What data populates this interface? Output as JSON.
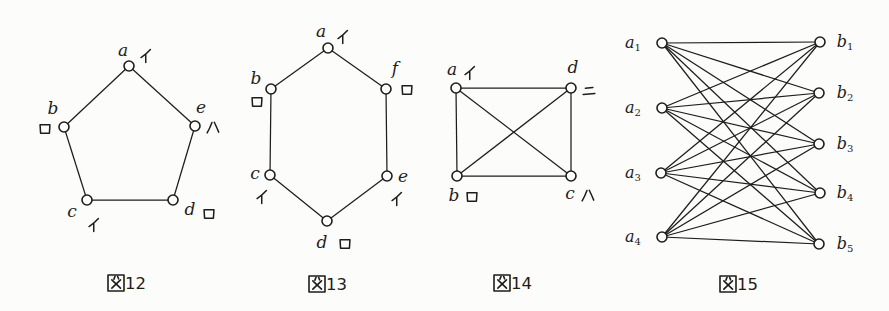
{
  "page": {
    "background": "#fcfcfa",
    "ink": "#1f1d1a",
    "vertex_fill": "#fdfdfb"
  },
  "figures": [
    {
      "name": "fig-12",
      "graph_type": "cycle-pentagon",
      "caption": {
        "text": "図12",
        "kanji": "図",
        "number": "12",
        "kx": 116,
        "dx": 125,
        "y": 289
      },
      "vertices": [
        {
          "id": "a",
          "x": 129,
          "y": 66,
          "label": "a",
          "lx": 123,
          "ly": 56,
          "kana": "イ",
          "kana_name": "i",
          "kx": 146,
          "ky": 56
        },
        {
          "id": "b",
          "x": 64,
          "y": 127,
          "label": "b",
          "lx": 53,
          "ly": 114,
          "kana": "ロ",
          "kana_name": "ro",
          "kx": 45,
          "ky": 129
        },
        {
          "id": "e",
          "x": 195,
          "y": 126,
          "label": "e",
          "lx": 201,
          "ly": 113,
          "kana": "ハ",
          "kana_name": "ha",
          "kx": 213,
          "ky": 128
        },
        {
          "id": "c",
          "x": 87,
          "y": 200,
          "label": "c",
          "lx": 72,
          "ly": 217,
          "kana": "イ",
          "kana_name": "i",
          "kx": 94,
          "ky": 225
        },
        {
          "id": "d",
          "x": 173,
          "y": 200,
          "label": "d",
          "lx": 190,
          "ly": 215,
          "kana": "ロ",
          "kana_name": "ro",
          "kx": 209,
          "ky": 214
        }
      ],
      "edges": [
        [
          "a",
          "b"
        ],
        [
          "a",
          "e"
        ],
        [
          "b",
          "c"
        ],
        [
          "e",
          "d"
        ],
        [
          "c",
          "d"
        ]
      ]
    },
    {
      "name": "fig-13",
      "graph_type": "cycle-hexagon",
      "caption": {
        "text": "図13",
        "kanji": "図",
        "number": "13",
        "kx": 317,
        "dx": 326,
        "y": 290
      },
      "vertices": [
        {
          "id": "a",
          "x": 328,
          "y": 48,
          "label": "a",
          "lx": 321,
          "ly": 37,
          "kana": "イ",
          "kana_name": "i",
          "kx": 343,
          "ky": 37
        },
        {
          "id": "b",
          "x": 271,
          "y": 89,
          "label": "b",
          "lx": 256,
          "ly": 84,
          "kana": "ロ",
          "kana_name": "ro",
          "kx": 257,
          "ky": 102
        },
        {
          "id": "f",
          "x": 386,
          "y": 89,
          "label": "f",
          "lx": 395,
          "ly": 74,
          "kana": "ロ",
          "kana_name": "ro",
          "kx": 407,
          "ky": 90
        },
        {
          "id": "c",
          "x": 270,
          "y": 175,
          "label": "c",
          "lx": 255,
          "ly": 179,
          "kana": "イ",
          "kana_name": "i",
          "kx": 262,
          "ky": 197
        },
        {
          "id": "e",
          "x": 387,
          "y": 176,
          "label": "e",
          "lx": 403,
          "ly": 182,
          "kana": "イ",
          "kana_name": "i",
          "kx": 397,
          "ky": 199
        },
        {
          "id": "d",
          "x": 327,
          "y": 221,
          "label": "d",
          "lx": 322,
          "ly": 248,
          "kana": "ロ",
          "kana_name": "ro",
          "kx": 345,
          "ky": 244
        }
      ],
      "edges": [
        [
          "a",
          "b"
        ],
        [
          "a",
          "f"
        ],
        [
          "b",
          "c"
        ],
        [
          "f",
          "e"
        ],
        [
          "c",
          "d"
        ],
        [
          "e",
          "d"
        ]
      ]
    },
    {
      "name": "fig-14",
      "graph_type": "complete-K4",
      "caption": {
        "text": "図14",
        "kanji": "図",
        "number": "14",
        "kx": 502,
        "dx": 511,
        "y": 289
      },
      "vertices": [
        {
          "id": "a",
          "x": 456,
          "y": 88,
          "label": "a",
          "lx": 452,
          "ly": 75,
          "kana": "イ",
          "kana_name": "i",
          "kx": 470,
          "ky": 73
        },
        {
          "id": "d",
          "x": 571,
          "y": 88,
          "label": "d",
          "lx": 573,
          "ly": 73,
          "kana": "ニ",
          "kana_name": "ni",
          "kx": 589,
          "ky": 91
        },
        {
          "id": "b",
          "x": 457,
          "y": 176,
          "label": "b",
          "lx": 454,
          "ly": 201,
          "kana": "ロ",
          "kana_name": "ro",
          "kx": 472,
          "ky": 197
        },
        {
          "id": "c",
          "x": 571,
          "y": 176,
          "label": "c",
          "lx": 570,
          "ly": 199,
          "kana": "ハ",
          "kana_name": "ha",
          "kx": 588,
          "ky": 196
        }
      ],
      "edges": [
        [
          "a",
          "d"
        ],
        [
          "a",
          "b"
        ],
        [
          "d",
          "c"
        ],
        [
          "b",
          "c"
        ],
        [
          "a",
          "c"
        ],
        [
          "b",
          "d"
        ]
      ]
    },
    {
      "name": "fig-15",
      "graph_type": "complete-bipartite-K45",
      "caption": {
        "text": "図15",
        "kanji": "図",
        "number": "15",
        "kx": 728,
        "dx": 737,
        "y": 290
      },
      "vertices": [
        {
          "id": "a1",
          "x": 662,
          "y": 43,
          "label": "a",
          "sub": "1",
          "lx": 633,
          "ly": 48
        },
        {
          "id": "a2",
          "x": 662,
          "y": 108,
          "label": "a",
          "sub": "2",
          "lx": 633,
          "ly": 113
        },
        {
          "id": "a3",
          "x": 661,
          "y": 173,
          "label": "a",
          "sub": "3",
          "lx": 633,
          "ly": 178
        },
        {
          "id": "a4",
          "x": 662,
          "y": 237,
          "label": "a",
          "sub": "4",
          "lx": 633,
          "ly": 242
        },
        {
          "id": "b1",
          "x": 820,
          "y": 42,
          "label": "b",
          "sub": "1",
          "lx": 845,
          "ly": 47
        },
        {
          "id": "b2",
          "x": 819,
          "y": 93,
          "label": "b",
          "sub": "2",
          "lx": 845,
          "ly": 98
        },
        {
          "id": "b3",
          "x": 819,
          "y": 144,
          "label": "b",
          "sub": "3",
          "lx": 845,
          "ly": 149
        },
        {
          "id": "b4",
          "x": 820,
          "y": 193,
          "label": "b",
          "sub": "4",
          "lx": 845,
          "ly": 198
        },
        {
          "id": "b5",
          "x": 819,
          "y": 244,
          "label": "b",
          "sub": "5",
          "lx": 845,
          "ly": 249
        }
      ],
      "edges": [
        [
          "a1",
          "b1"
        ],
        [
          "a1",
          "b2"
        ],
        [
          "a1",
          "b3"
        ],
        [
          "a1",
          "b4"
        ],
        [
          "a1",
          "b5"
        ],
        [
          "a2",
          "b1"
        ],
        [
          "a2",
          "b2"
        ],
        [
          "a2",
          "b3"
        ],
        [
          "a2",
          "b4"
        ],
        [
          "a2",
          "b5"
        ],
        [
          "a3",
          "b1"
        ],
        [
          "a3",
          "b2"
        ],
        [
          "a3",
          "b3"
        ],
        [
          "a3",
          "b4"
        ],
        [
          "a3",
          "b5"
        ],
        [
          "a4",
          "b1"
        ],
        [
          "a4",
          "b2"
        ],
        [
          "a4",
          "b3"
        ],
        [
          "a4",
          "b4"
        ],
        [
          "a4",
          "b5"
        ]
      ]
    }
  ]
}
